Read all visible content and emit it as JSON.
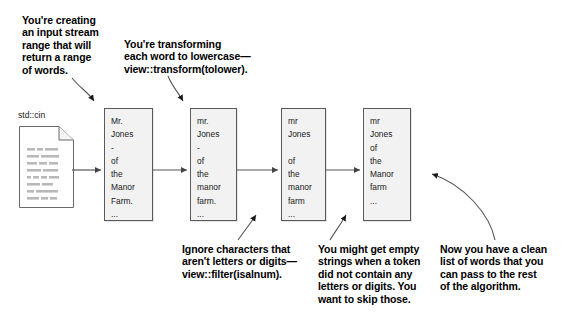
{
  "diagram": {
    "title_note": "Range pipeline for word extraction from std::cin",
    "source": {
      "label": "std::cin",
      "icon": "document-icon"
    },
    "boxes": [
      {
        "id": "box-raw-words",
        "lines": "Mr.\nJones\n-\nof\nthe\nManor\nFarm.\n..."
      },
      {
        "id": "box-lowercased",
        "lines": "mr.\nJones\n-\nof\nthe\nmanor\nfarm.\n..."
      },
      {
        "id": "box-filtered",
        "lines": "mr\nJones\n\nof\nthe\nmanor\nfarm\n..."
      },
      {
        "id": "box-nonempty",
        "lines": "mr\nJones\nof\nthe\nManor\nfarm\n..."
      }
    ],
    "annotations": [
      {
        "id": "annotation-input-stream",
        "text": "You're creating\nan input stream\nrange that will\nreturn a range\nof words."
      },
      {
        "id": "annotation-transform",
        "text": "You're transforming\neach word to lowercase—\nview::transform(tolower)."
      },
      {
        "id": "annotation-filter",
        "text": "Ignore characters that\naren't letters or digits—\nview::filter(isalnum)."
      },
      {
        "id": "annotation-empty-strings",
        "text": "You might get empty\nstrings when a token\ndid not contain any\nletters or digits. You\nwant to skip those."
      },
      {
        "id": "annotation-clean-list",
        "text": "Now you have a clean\nlist of words that you\ncan pass to the rest\nof the algorithm."
      }
    ],
    "colors": {
      "box_fill": "#f2f2f2",
      "box_stroke": "#5a5a5a",
      "line": "#555555",
      "text": "#000000",
      "background": "#ffffff"
    }
  }
}
